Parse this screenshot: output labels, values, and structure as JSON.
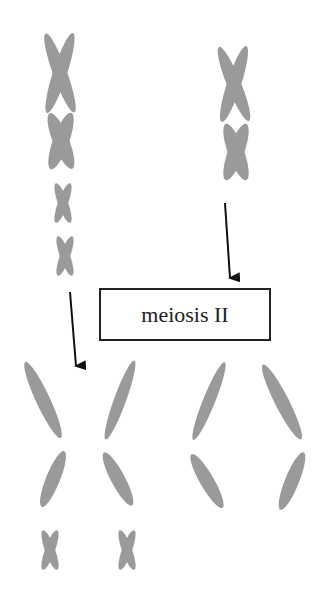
{
  "diagram": {
    "label": "meiosis II",
    "colors": {
      "chromosome": "#9a9a9a",
      "arrow": "#111111",
      "box_border": "#222222"
    },
    "left_cell_before": {
      "chromosomes": [
        "large-x",
        "large-x",
        "small-x",
        "small-x"
      ]
    },
    "right_cell_before": {
      "chromosomes": [
        "large-x",
        "large-x"
      ]
    },
    "left_products": {
      "chromatids": [
        "\\",
        "/",
        "/",
        "\\"
      ],
      "small_chromosomes": [
        "small-x",
        "small-x"
      ]
    },
    "right_products": {
      "chromatids": [
        "/",
        "\\",
        "\\",
        "/"
      ]
    }
  }
}
